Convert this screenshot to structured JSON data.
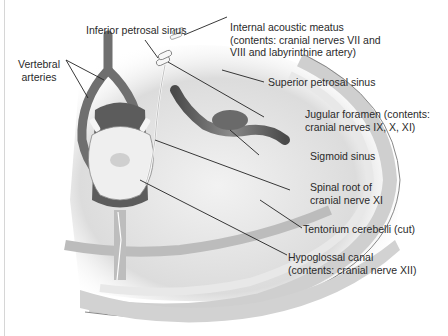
{
  "figure": {
    "labels": {
      "inferior_petrosal_sinus": [
        "Inferior petrosal sinus"
      ],
      "internal_acoustic_meatus": [
        "Internal acoustic meatus",
        "(contents: cranial nerves VII and",
        "VIII and labyrinthine artery)"
      ],
      "vertebral_arteries": [
        "Vertebral",
        "arteries"
      ],
      "superior_petrosal_sinus": [
        "Superior petrosal sinus"
      ],
      "jugular_foramen": [
        "Jugular foramen (contents:",
        "cranial nerves IX, X, XI)"
      ],
      "sigmoid_sinus": [
        "Sigmoid sinus"
      ],
      "spinal_root_xi": [
        "Spinal root of",
        "cranial nerve XI"
      ],
      "tentorium_cerebelli": [
        "Tentorium cerebelli (cut)"
      ],
      "hypoglossal_canal": [
        "Hypoglossal canal",
        "(contents: cranial nerve XII)"
      ]
    },
    "colors": {
      "background": "#ffffff",
      "bone": "#e4e4e4",
      "vessel": "#6e6e6e",
      "brainstem": "#ececec",
      "dark_tissue": "#555555",
      "leader": "#222222"
    }
  }
}
